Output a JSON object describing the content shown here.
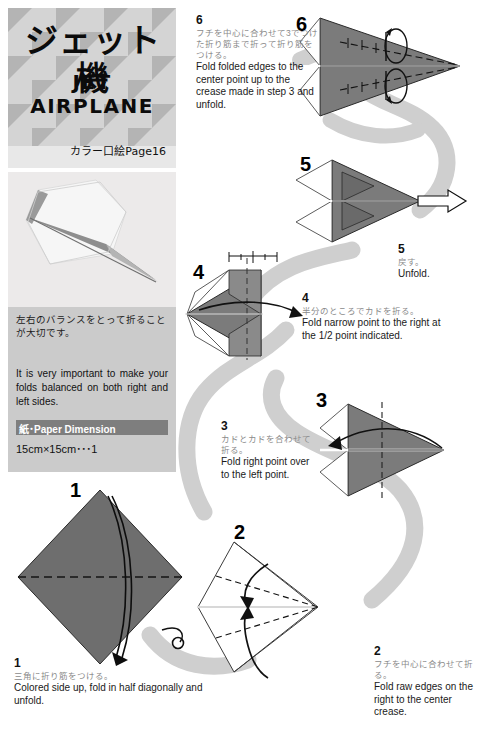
{
  "title": {
    "jp": "ジェット機",
    "en_line1": "JET",
    "en_line2": "AIRPLANE",
    "reference": "カラー口絵Page16"
  },
  "photo": {
    "alt": "folded white jet airplane origami model"
  },
  "info": {
    "jp": "左右のバランスをとって折ることが大切です。",
    "en": "It is very important to make your folds balanced on both right and left sides.",
    "paper_bar_label": "紙･Paper Dimension",
    "paper_dimension": "15cm×15cm･･･1"
  },
  "steps": [
    {
      "number": "1",
      "jp": "三角に折り筋をつける。",
      "en": "Colored side up, fold in half diagonally and unfold."
    },
    {
      "number": "2",
      "jp": "フチを中心に合わせて折る。",
      "en": "Fold raw edges on the right to the center crease."
    },
    {
      "number": "3",
      "jp": "カドとカドを合わせて折る。",
      "en": "Fold right point over to the left point."
    },
    {
      "number": "4",
      "jp": "半分のところでカドを折る。",
      "en": "Fold narrow point to the right at the 1/2 point indicated."
    },
    {
      "number": "5",
      "jp": "戻す。",
      "en": "Unfold."
    },
    {
      "number": "6",
      "jp": "フチを中心に合わせて3でつけた折り筋まで折って折り筋をつける。",
      "en": "Fold folded edges to the center point up to the crease made in step 3 and unfold."
    }
  ],
  "figure_labels": {
    "f1": "1",
    "f2": "2",
    "f3": "3",
    "f4": "4",
    "f5": "5",
    "f6": "6"
  },
  "colors": {
    "paper_gray": "#7b7b7b",
    "paper_gray_dark": "#6a6a6a",
    "ribbon": "#cfcfcf",
    "panel_bg": "#cbcbcb",
    "title_bg": "#d2d2d2",
    "bar_bg": "#7e7e7e",
    "jp_text": "#8a8a8a",
    "en_text": "#1a1a1a"
  }
}
